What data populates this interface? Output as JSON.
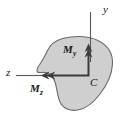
{
  "figure": {
    "background_color": "#ffffff"
  },
  "shape": {
    "name": "cross-section-area",
    "fill_color": "#cfcfcf",
    "stroke_color": "#6b6b6b",
    "description": "irregular shaded plane area representing a beam cross section"
  },
  "axes": [
    {
      "id": "y",
      "label": "y",
      "orientation": "vertical",
      "direction": "up",
      "color": "#5a5a5a"
    },
    {
      "id": "z",
      "label": "z",
      "orientation": "horizontal",
      "direction": "left",
      "color": "#5a5a5a"
    }
  ],
  "vectors": [
    {
      "id": "My",
      "label": "M",
      "subscript": "y",
      "arrowhead": "double",
      "direction": "up",
      "color": "#3c3c3c"
    },
    {
      "id": "Mz",
      "label": "M",
      "subscript": "z",
      "arrowhead": "double",
      "direction": "left",
      "color": "#3c3c3c"
    }
  ],
  "points": [
    {
      "id": "C",
      "label": "C",
      "description": "centroid of the cross section"
    }
  ]
}
